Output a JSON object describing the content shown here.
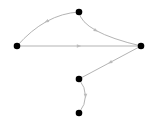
{
  "diagram": {
    "type": "directed-graph",
    "node_color": "#000000",
    "edge_color": "#aaaaaa",
    "nodes": [
      {
        "id": "A"
      },
      {
        "id": "B"
      },
      {
        "id": "C"
      },
      {
        "id": "D"
      },
      {
        "id": "E"
      }
    ],
    "edges": [
      {
        "from": "A",
        "to": "B",
        "style": "curved"
      },
      {
        "from": "A",
        "to": "C",
        "style": "curved"
      },
      {
        "from": "B",
        "to": "C",
        "style": "straight"
      },
      {
        "from": "C",
        "to": "D",
        "style": "straight"
      },
      {
        "from": "D",
        "to": "E",
        "style": "curved"
      }
    ]
  }
}
